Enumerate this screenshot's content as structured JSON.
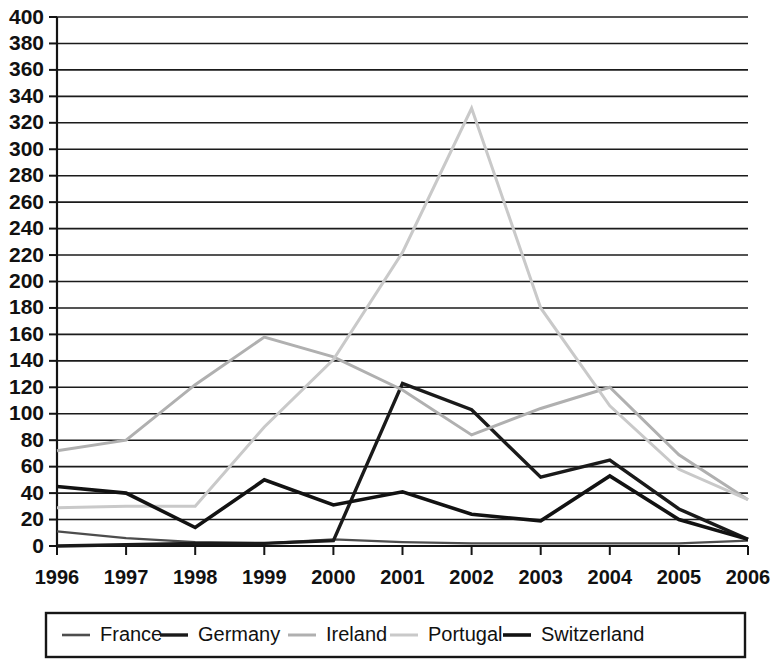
{
  "chart_data": {
    "type": "line",
    "title": "",
    "subtitle": "",
    "xlabel": "",
    "ylabel": "",
    "categories": [
      "1996",
      "1997",
      "1998",
      "1999",
      "2000",
      "2001",
      "2002",
      "2003",
      "2004",
      "2005",
      "2006"
    ],
    "ylim": [
      0,
      400
    ],
    "ytick_step": 20,
    "yticks": [
      0,
      20,
      40,
      60,
      80,
      100,
      120,
      140,
      160,
      180,
      200,
      220,
      240,
      260,
      280,
      300,
      320,
      340,
      360,
      380,
      400
    ],
    "ytick_labels": [
      "0",
      "20",
      "40",
      "60",
      "80",
      "100",
      "120",
      "140",
      "160",
      "180",
      "200",
      "220",
      "240",
      "260",
      "280",
      "300",
      "320",
      "340",
      "360",
      "380",
      "400"
    ],
    "grid": true,
    "grid_axis": "y",
    "legend_position": "bottom",
    "series": [
      {
        "name": "France",
        "color": "#4d4d4d",
        "width": 2.2,
        "values": [
          11,
          6,
          3,
          2,
          5,
          3,
          2,
          2,
          2,
          2,
          4
        ]
      },
      {
        "name": "Germany",
        "color": "#1a1a1a",
        "width": 3.4,
        "values": [
          0,
          1,
          2,
          2,
          4,
          123,
          103,
          52,
          65,
          28,
          5
        ]
      },
      {
        "name": "Ireland",
        "color": "#b0b0b0",
        "width": 3.0,
        "values": [
          72,
          80,
          122,
          158,
          143,
          118,
          84,
          104,
          120,
          69,
          35
        ]
      },
      {
        "name": "Portugal",
        "color": "#c9c9c9",
        "width": 3.0,
        "values": [
          29,
          30,
          30,
          90,
          141,
          222,
          331,
          180,
          106,
          58,
          35
        ]
      },
      {
        "name": "Switzerland",
        "color": "#121212",
        "width": 3.6,
        "values": [
          45,
          40,
          14,
          50,
          31,
          41,
          24,
          19,
          53,
          20,
          5
        ]
      }
    ]
  },
  "legend": {
    "entries": [
      {
        "label": "France"
      },
      {
        "label": "Germany"
      },
      {
        "label": "Ireland"
      },
      {
        "label": "Portugal"
      },
      {
        "label": "Switzerland"
      }
    ]
  }
}
